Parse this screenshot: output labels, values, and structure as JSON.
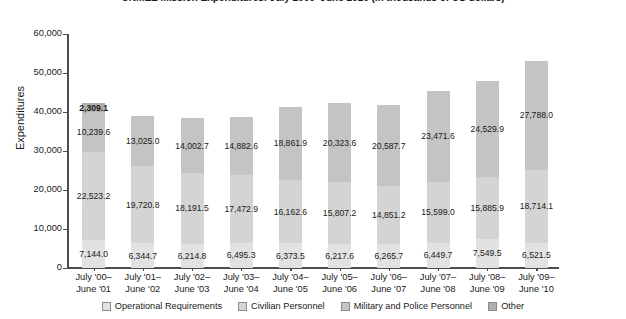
{
  "chart_data": {
    "type": "bar",
    "subtype": "stacked-vertical",
    "title": "UNMEE Mission Expenditures: July 2000–June 2010 (in thousands of US dollars)",
    "xlabel": "",
    "ylabel": "Expenditures",
    "ylim": [
      0,
      60000
    ],
    "ytick_labels": [
      "60,000",
      "50,000",
      "40,000",
      "30,000",
      "20,000",
      "10,000",
      "0"
    ],
    "ytick_values": [
      60000,
      50000,
      40000,
      30000,
      20000,
      10000,
      0
    ],
    "grid": false,
    "legend_position": "bottom",
    "categories": [
      "July '00–\nJune '01",
      "July '01–\nJune '02",
      "July '02–\nJune '03",
      "July '03–\nJune '04",
      "July '04–\nJune '05",
      "July '05–\nJune '06",
      "July '06–\nJune '07",
      "July '07–\nJune '08",
      "July '08–\nJune '09",
      "July '09–\nJune '10"
    ],
    "categories_lines": [
      [
        "July '00–",
        "June '01"
      ],
      [
        "July '01–",
        "June '02"
      ],
      [
        "July '02–",
        "June '03"
      ],
      [
        "July '03–",
        "June '04"
      ],
      [
        "July '04–",
        "June '05"
      ],
      [
        "July '05–",
        "June '06"
      ],
      [
        "July '06–",
        "June '07"
      ],
      [
        "July '07–",
        "June '08"
      ],
      [
        "July '08–",
        "June '09"
      ],
      [
        "July '09–",
        "June '10"
      ]
    ],
    "series": [
      {
        "name": "Operational Requirements",
        "color": "#e2e2e2",
        "values": [
          7144.0,
          6344.7,
          6214.8,
          6495.3,
          6373.5,
          6217.6,
          6265.7,
          6449.7,
          7549.5,
          6521.5
        ],
        "labels": [
          "7,144.0",
          "6,344.7",
          "6,214.8",
          "6,495.3",
          "6,373.5",
          "6,217.6",
          "6,265.7",
          "6,449.7",
          "7,549.5",
          "6,521.5"
        ]
      },
      {
        "name": "Civilian Personnel",
        "color": "#d4d4d4",
        "values": [
          22523.2,
          19720.8,
          18191.5,
          17472.9,
          16162.6,
          15807.2,
          14851.2,
          15599.0,
          15885.9,
          18714.1
        ],
        "labels": [
          "22,523.2",
          "19,720.8",
          "18,191.5",
          "17,472.9",
          "16,162.6",
          "15,807.2",
          "14,851.2",
          "15,599.0",
          "15,885.9",
          "18,714.1"
        ]
      },
      {
        "name": "Military and Police Personnel",
        "color": "#c4c4c4",
        "values": [
          10239.6,
          13025.0,
          14002.7,
          14882.6,
          18861.9,
          20323.6,
          20587.7,
          23471.6,
          24529.9,
          27788.0
        ],
        "labels": [
          "10,239.6",
          "13,025.0",
          "14,002.7",
          "14,882.6",
          "18,861.9",
          "20,323.6",
          "20,587.7",
          "23,471.6",
          "24,529.9",
          "27,788.0"
        ]
      },
      {
        "name": "Other",
        "color": "#b0b0b0",
        "values": [
          2309.1,
          0,
          0,
          0,
          0,
          0,
          0,
          0,
          0,
          0
        ],
        "labels": [
          "2,309.1",
          "",
          "",
          "",
          "",
          "",
          "",
          "",
          "",
          ""
        ]
      }
    ],
    "totals": [
      42215.9,
      39090.5,
      38409.0,
      38850.8,
      41398.0,
      42348.4,
      41704.6,
      45520.3,
      47965.3,
      53023.6
    ]
  },
  "legend": {
    "items": [
      {
        "label": "Operational Requirements",
        "color": "#e2e2e2"
      },
      {
        "label": "Civilian Personnel",
        "color": "#d4d4d4"
      },
      {
        "label": "Military and Police Personnel",
        "color": "#c4c4c4"
      },
      {
        "label": "Other",
        "color": "#b0b0b0"
      }
    ]
  }
}
